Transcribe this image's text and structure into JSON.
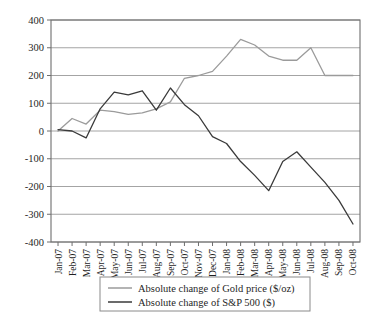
{
  "chart_data": {
    "type": "line",
    "title": "",
    "xlabel": "",
    "ylabel": "",
    "ylim": [
      -400,
      400
    ],
    "ytick_step": 100,
    "grid": true,
    "legend_position": "bottom",
    "categories": [
      "Jan-07",
      "Feb-07",
      "Mar-07",
      "Apr-07",
      "May-07",
      "Jun-07",
      "Jul-07",
      "Aug-07",
      "Sep-07",
      "Oct-07",
      "Nov-07",
      "Dec-07",
      "Jan-08",
      "Feb-08",
      "Mar-08",
      "Apr-08",
      "May-08",
      "Jun-08",
      "Jul-08",
      "Aug-08",
      "Sep-08",
      "Oct-08"
    ],
    "yticks": [
      400,
      300,
      200,
      100,
      0,
      -100,
      -200,
      -300,
      -400
    ],
    "ytick_labels": [
      "400",
      "300",
      "200",
      "100",
      "0",
      "-100",
      "-200",
      "-300",
      "-400"
    ],
    "series": [
      {
        "name": "Absolute change of Gold price ($/oz)",
        "color": "#9b9b9b",
        "width": 1.3,
        "values": [
          0,
          45,
          25,
          75,
          70,
          60,
          65,
          80,
          105,
          190,
          200,
          215,
          270,
          330,
          310,
          270,
          255,
          255,
          300,
          200,
          200,
          200
        ]
      },
      {
        "name": "Absolute change of S&P 500 ($)",
        "color": "#3a3a3a",
        "width": 1.3,
        "values": [
          5,
          0,
          -25,
          80,
          140,
          130,
          145,
          75,
          155,
          95,
          55,
          -20,
          -45,
          -110,
          -160,
          -215,
          -110,
          -75,
          -130,
          -185,
          -250,
          -335
        ]
      }
    ]
  },
  "legend": {
    "entries": [
      "Absolute change of Gold price ($/oz)",
      "Absolute change of S&P 500 ($)"
    ]
  }
}
